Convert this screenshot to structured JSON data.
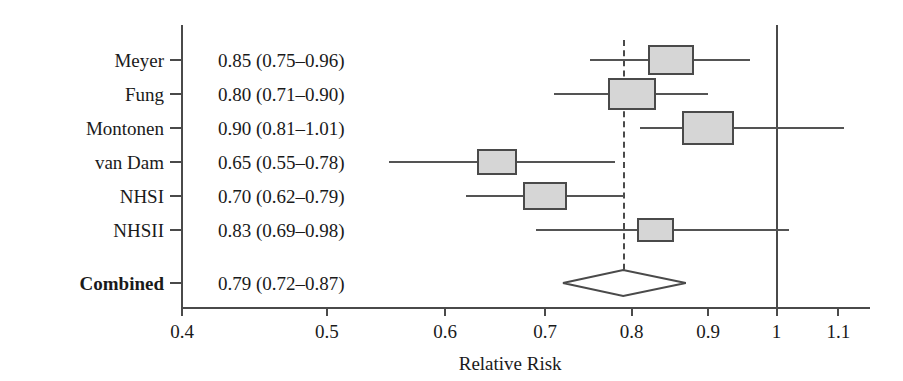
{
  "chart_data": {
    "type": "forest",
    "title": "",
    "xlabel": "Relative Risk",
    "ylabel": "",
    "xscale": "log",
    "xlim": [
      0.385,
      1.16
    ],
    "xticks": [
      0.4,
      0.5,
      0.6,
      0.7,
      0.8,
      0.9,
      1,
      1.1
    ],
    "xticklabels": [
      "0.4",
      "0.5",
      "0.6",
      "0.7",
      "0.8",
      "0.9",
      "1",
      "1.1"
    ],
    "grid": false,
    "legend": null,
    "reference_line": {
      "value": 1,
      "style": "solid"
    },
    "pooled_line": {
      "value": 0.79,
      "style": "dashed"
    },
    "effect_measure": "Relative Risk",
    "studies": [
      {
        "label": "Meyer",
        "text": "0.85 (0.75–0.96)",
        "estimate": 0.85,
        "ci_low": 0.75,
        "ci_high": 0.96,
        "weight": 0.8,
        "bold": false
      },
      {
        "label": "Fung",
        "text": "0.80 (0.71–0.90)",
        "estimate": 0.8,
        "ci_low": 0.71,
        "ci_high": 0.9,
        "weight": 0.85,
        "bold": false
      },
      {
        "label": "Montonen",
        "text": "0.90 (0.81–1.01)",
        "estimate": 0.9,
        "ci_low": 0.81,
        "ci_high": 1.11,
        "weight": 1.0,
        "bold": false
      },
      {
        "label": "van Dam",
        "text": "0.65 (0.55–0.78)",
        "estimate": 0.65,
        "ci_low": 0.55,
        "ci_high": 0.78,
        "weight": 0.52,
        "bold": false
      },
      {
        "label": "NHSI",
        "text": "0.70 (0.62–0.79)",
        "estimate": 0.7,
        "ci_low": 0.62,
        "ci_high": 0.79,
        "weight": 0.72,
        "bold": false
      },
      {
        "label": "NHSII",
        "text": "0.83 (0.69–0.98)",
        "estimate": 0.83,
        "ci_low": 0.69,
        "ci_high": 1.02,
        "weight": 0.44,
        "bold": false
      }
    ],
    "summary": {
      "label": "Combined",
      "text": "0.79 (0.72–0.87)",
      "estimate": 0.79,
      "ci_low": 0.72,
      "ci_high": 0.87,
      "bold": true
    }
  },
  "colors": {
    "box_fill": "#d6d6d6",
    "box_border": "#4a4a4a",
    "line": "#545454",
    "axis": "#4a4a4a",
    "text": "#1a1a1a",
    "background": "#ffffff"
  }
}
